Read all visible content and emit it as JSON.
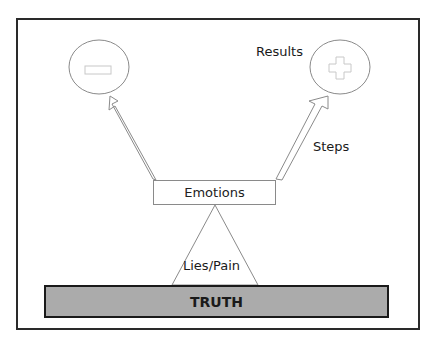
{
  "diagram": {
    "nodes": {
      "negative": {
        "symbol": "minus-icon"
      },
      "positive": {
        "symbol": "plus-icon"
      },
      "emotions": "Emotions",
      "truth": "TRUTH"
    },
    "labels": {
      "results": "Results",
      "steps": "Steps",
      "lies_pain": "Lies/Pain"
    },
    "colors": {
      "frame": "#2a2a2a",
      "truth_fill": "#ababab",
      "outline": "#8a8a8a"
    }
  }
}
